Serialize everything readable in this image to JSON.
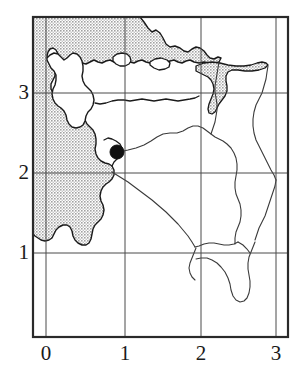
{
  "figure": {
    "kind": "map",
    "title": ""
  },
  "axes": {
    "x_label": "",
    "y_label": "",
    "x_ticks": [
      {
        "value": 0,
        "label": "0",
        "px": 46
      },
      {
        "value": 1,
        "label": "1",
        "px": 125
      },
      {
        "value": 2,
        "label": "2",
        "px": 201
      },
      {
        "value": 3,
        "label": "3",
        "px": 276
      }
    ],
    "y_ticks": [
      {
        "value": 3,
        "label": "3",
        "px": 93
      },
      {
        "value": 2,
        "label": "2",
        "px": 173
      },
      {
        "value": 1,
        "label": "1",
        "px": 253
      }
    ],
    "frame": {
      "left": 33,
      "top": 17,
      "right": 288,
      "bottom": 337
    },
    "grid": "on",
    "grid_color": "#4a4a4a",
    "frame_color": "#2a2a2a"
  },
  "markers": [
    {
      "name": "city-marker",
      "x_data": 0.9,
      "y_data": 2.25,
      "px": 117,
      "py": 152,
      "radius": 7,
      "color": "#111111"
    }
  ],
  "colors": {
    "sea_fill": "#c9c9c9",
    "land_fill": "#ffffff",
    "coastline": "#1a1a1a",
    "river": "#3a3a3a",
    "text": "#1a1a1a",
    "background": "#ffffff"
  },
  "legend": {
    "visible": false,
    "entries": []
  }
}
